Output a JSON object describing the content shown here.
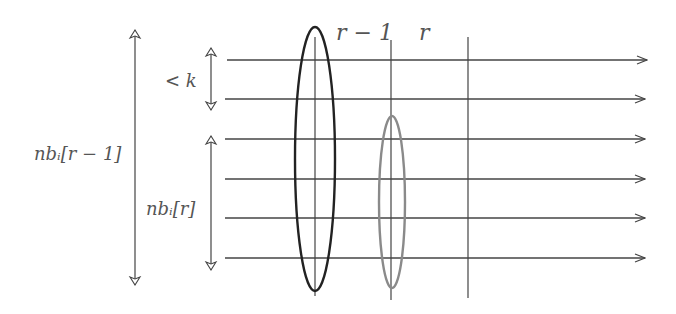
{
  "diagram": {
    "colors": {
      "line": "#444444",
      "ellipse_prev": "#222222",
      "ellipse_curr": "#8a8a8a",
      "label": "#555555",
      "background": "#ffffff"
    },
    "column_labels": {
      "prev": "r − 1",
      "curr": "r"
    },
    "brace_labels": {
      "gap": "< k",
      "nb_prev": "nbᵢ[r − 1]",
      "nb_curr": "nbᵢ[r]"
    },
    "horizontal_lines": [
      {
        "y": 60,
        "x1": 227,
        "x2": 647
      },
      {
        "y": 99,
        "x1": 225,
        "x2": 645
      },
      {
        "y": 139,
        "x1": 225,
        "x2": 645
      },
      {
        "y": 179,
        "x1": 225,
        "x2": 645
      },
      {
        "y": 218,
        "x1": 225,
        "x2": 645
      },
      {
        "y": 258,
        "x1": 225,
        "x2": 645
      }
    ],
    "vertical_lines": [
      {
        "x": 315,
        "y1": 37,
        "y2": 296
      },
      {
        "x": 391,
        "y1": 40,
        "y2": 300
      },
      {
        "x": 468,
        "y1": 37,
        "y2": 298
      }
    ],
    "ellipses": [
      {
        "name": "round-r-minus-1",
        "cx": 315,
        "cy": 159,
        "rx": 20,
        "ry": 132,
        "color": "#222222",
        "width": 2.4
      },
      {
        "name": "round-r",
        "cx": 392,
        "cy": 202,
        "rx": 13,
        "ry": 86,
        "color": "#8a8a8a",
        "width": 2.4
      }
    ],
    "double_arrows": [
      {
        "name": "nb-prev-arrow",
        "x": 135,
        "y1": 30,
        "y2": 285
      },
      {
        "name": "gap-k-arrow",
        "x": 211,
        "y1": 48,
        "y2": 110
      },
      {
        "name": "nb-curr-arrow",
        "x": 211,
        "y1": 136,
        "y2": 270
      }
    ]
  }
}
